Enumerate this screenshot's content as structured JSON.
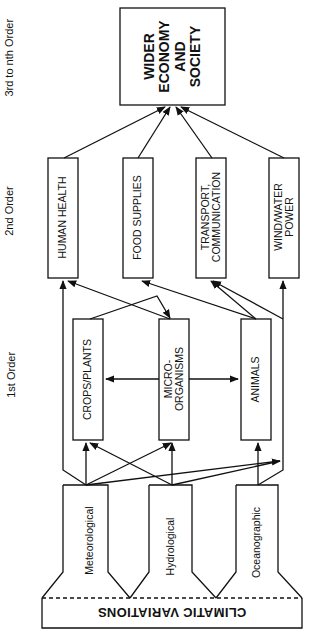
{
  "levels": {
    "third": "3rd to nth Order",
    "second": "2nd Order",
    "first": "1st Order"
  },
  "top_box": {
    "lines": [
      "WIDER",
      "ECONOMY",
      "AND",
      "SOCIETY"
    ]
  },
  "second_order": [
    {
      "lines": [
        "HUMAN HEALTH"
      ]
    },
    {
      "lines": [
        "FOOD SUPPLIES"
      ]
    },
    {
      "lines": [
        "TRANSPORT,",
        "COMMUNICATION"
      ]
    },
    {
      "lines": [
        "WIND/WATER",
        "POWER"
      ]
    }
  ],
  "first_order": [
    {
      "lines": [
        "CROPS/PLANTS"
      ]
    },
    {
      "lines": [
        "MICRO-",
        "ORGANISMS"
      ]
    },
    {
      "lines": [
        "ANIMALS"
      ]
    }
  ],
  "sources": [
    {
      "label": "Meteorological"
    },
    {
      "label": "Hydrological"
    },
    {
      "label": "Oceanographic"
    }
  ],
  "base": {
    "label": "CLIMATIC VARIATIONS"
  },
  "colors": {
    "line": "#111111",
    "background": "#ffffff"
  }
}
